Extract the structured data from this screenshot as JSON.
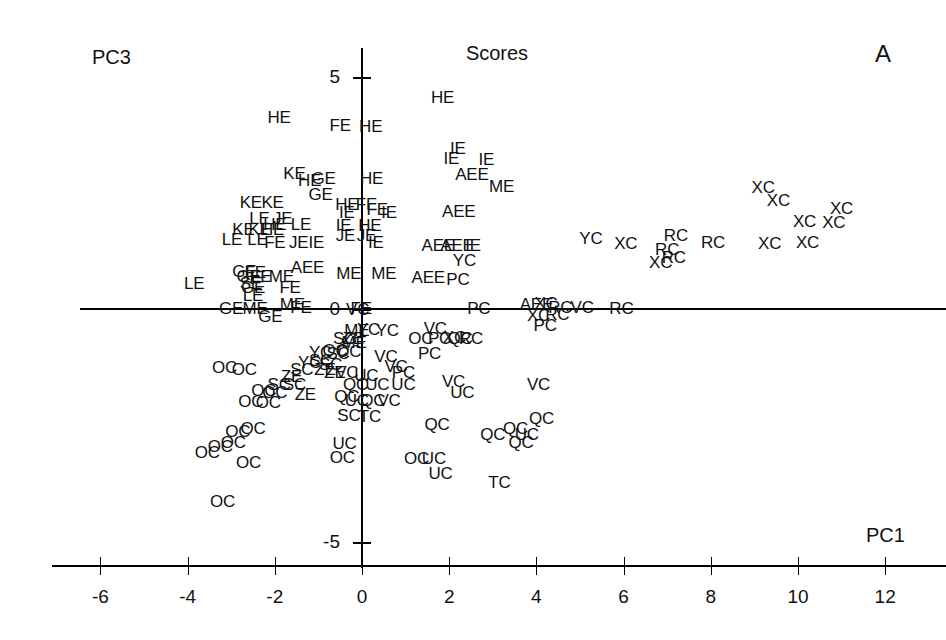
{
  "chart_data": {
    "type": "scatter",
    "title": "Scores",
    "panel_label": "A",
    "xlabel": "PC1",
    "ylabel": "PC3",
    "xlim": [
      -6.6,
      12.6
    ],
    "ylim": [
      -5.6,
      5.6
    ],
    "xticks": [
      -6,
      -4,
      -2,
      0,
      2,
      4,
      6,
      8,
      10,
      12
    ],
    "xtick_labels": [
      "-6",
      "-4",
      "-2",
      "0",
      "2",
      "4",
      "6",
      "8",
      "10",
      "12"
    ],
    "yticks": [
      -5,
      0,
      5
    ],
    "ytick_labels": [
      "-5",
      "0",
      "5"
    ],
    "grid": false,
    "legend": "none",
    "marker_style": "text-label",
    "group_labels": [
      "HE",
      "FE",
      "GE",
      "KE",
      "LE",
      "JE",
      "IE",
      "ME",
      "AEE",
      "YC",
      "XC",
      "RC",
      "VC",
      "PC",
      "OC",
      "SC",
      "ZE",
      "UC",
      "QC",
      "TC"
    ],
    "points": [
      {
        "label": "HE",
        "x": -1.9,
        "y": 4.12
      },
      {
        "label": "FE",
        "x": -0.5,
        "y": 3.95
      },
      {
        "label": "HE",
        "x": 0.2,
        "y": 3.93
      },
      {
        "label": "HE",
        "x": 1.85,
        "y": 4.55
      },
      {
        "label": "IE",
        "x": 2.2,
        "y": 3.47
      },
      {
        "label": "IE",
        "x": 2.05,
        "y": 3.25
      },
      {
        "label": "IE",
        "x": 2.85,
        "y": 3.22
      },
      {
        "label": "KE",
        "x": -1.55,
        "y": 2.92
      },
      {
        "label": "HE",
        "x": -1.2,
        "y": 2.78
      },
      {
        "label": "GE",
        "x": -0.88,
        "y": 2.82
      },
      {
        "label": "HE",
        "x": 0.22,
        "y": 2.82
      },
      {
        "label": "AEE",
        "x": 2.52,
        "y": 2.9
      },
      {
        "label": "ME",
        "x": 3.2,
        "y": 2.65
      },
      {
        "label": "GE",
        "x": -0.95,
        "y": 2.48
      },
      {
        "label": "KE",
        "x": -2.55,
        "y": 2.3
      },
      {
        "label": "KE",
        "x": -2.05,
        "y": 2.3
      },
      {
        "label": "HE",
        "x": -0.35,
        "y": 2.25
      },
      {
        "label": "FE",
        "x": 0.1,
        "y": 2.25
      },
      {
        "label": "IE",
        "x": -0.35,
        "y": 2.08
      },
      {
        "label": "FE",
        "x": 0.35,
        "y": 2.16
      },
      {
        "label": "IE",
        "x": 0.62,
        "y": 2.08
      },
      {
        "label": "AEE",
        "x": 2.22,
        "y": 2.1
      },
      {
        "label": "XC",
        "x": 9.2,
        "y": 2.62
      },
      {
        "label": "XC",
        "x": 9.55,
        "y": 2.35
      },
      {
        "label": "XC",
        "x": 11.0,
        "y": 2.18
      },
      {
        "label": "LE",
        "x": -2.35,
        "y": 1.95
      },
      {
        "label": "JE",
        "x": -1.82,
        "y": 1.95
      },
      {
        "label": "HE",
        "x": -2.0,
        "y": 1.82
      },
      {
        "label": "LE",
        "x": -1.4,
        "y": 1.82
      },
      {
        "label": "IE",
        "x": -0.42,
        "y": 1.8
      },
      {
        "label": "HE",
        "x": 0.18,
        "y": 1.8
      },
      {
        "label": "KE",
        "x": -2.72,
        "y": 1.72
      },
      {
        "label": "KE",
        "x": -2.35,
        "y": 1.72
      },
      {
        "label": "HE",
        "x": -2.05,
        "y": 1.72
      },
      {
        "label": "JE",
        "x": -0.38,
        "y": 1.6
      },
      {
        "label": "JE",
        "x": 0.1,
        "y": 1.6
      },
      {
        "label": "RC",
        "x": 7.2,
        "y": 1.6
      },
      {
        "label": "XC",
        "x": 10.15,
        "y": 1.9
      },
      {
        "label": "XC",
        "x": 10.82,
        "y": 1.88
      },
      {
        "label": "LE",
        "x": -2.98,
        "y": 1.5
      },
      {
        "label": "LE",
        "x": -2.4,
        "y": 1.5
      },
      {
        "label": "FE",
        "x": -2.0,
        "y": 1.45
      },
      {
        "label": "JE",
        "x": -1.45,
        "y": 1.45
      },
      {
        "label": "IE",
        "x": -1.05,
        "y": 1.45
      },
      {
        "label": "IE",
        "x": 0.32,
        "y": 1.45
      },
      {
        "label": "AEE",
        "x": 1.75,
        "y": 1.38
      },
      {
        "label": "AEE",
        "x": 2.18,
        "y": 1.38
      },
      {
        "label": "IE",
        "x": 2.55,
        "y": 1.38
      },
      {
        "label": "YC",
        "x": 5.25,
        "y": 1.52
      },
      {
        "label": "XC",
        "x": 6.05,
        "y": 1.42
      },
      {
        "label": "RC",
        "x": 7.0,
        "y": 1.3
      },
      {
        "label": "RC",
        "x": 7.15,
        "y": 1.12
      },
      {
        "label": "XC",
        "x": 6.85,
        "y": 1.02
      },
      {
        "label": "RC",
        "x": 8.05,
        "y": 1.45
      },
      {
        "label": "XC",
        "x": 9.35,
        "y": 1.42
      },
      {
        "label": "XC",
        "x": 10.22,
        "y": 1.45
      },
      {
        "label": "GE",
        "x": -2.7,
        "y": 0.82
      },
      {
        "label": "GE",
        "x": -2.6,
        "y": 0.72
      },
      {
        "label": "FE",
        "x": -2.45,
        "y": 0.8
      },
      {
        "label": "FE",
        "x": -2.32,
        "y": 0.72
      },
      {
        "label": "ME",
        "x": -1.85,
        "y": 0.72
      },
      {
        "label": "AEE",
        "x": -1.25,
        "y": 0.9
      },
      {
        "label": "ME",
        "x": -0.3,
        "y": 0.78
      },
      {
        "label": "ME",
        "x": 0.5,
        "y": 0.78
      },
      {
        "label": "AEE",
        "x": 1.52,
        "y": 0.68
      },
      {
        "label": "PC",
        "x": 2.2,
        "y": 0.65
      },
      {
        "label": "YC",
        "x": 2.35,
        "y": 1.05
      },
      {
        "label": "SE",
        "x": -2.55,
        "y": 0.55
      },
      {
        "label": "GE",
        "x": -2.5,
        "y": 0.48
      },
      {
        "label": "FE",
        "x": -1.65,
        "y": 0.48
      },
      {
        "label": "LE",
        "x": -3.85,
        "y": 0.55
      },
      {
        "label": "LE",
        "x": -2.5,
        "y": 0.3
      },
      {
        "label": "GE",
        "x": -3.0,
        "y": 0.02
      },
      {
        "label": "GE",
        "x": -2.1,
        "y": -0.15
      },
      {
        "label": "ME",
        "x": -2.45,
        "y": 0.02
      },
      {
        "label": "ME",
        "x": -1.6,
        "y": 0.1
      },
      {
        "label": "FE",
        "x": -1.4,
        "y": 0.05
      },
      {
        "label": "VC",
        "x": -0.1,
        "y": 0.0
      },
      {
        "label": "FE",
        "x": -0.02,
        "y": 0.02
      },
      {
        "label": "ME",
        "x": -0.12,
        "y": -0.45
      },
      {
        "label": "PC",
        "x": 2.68,
        "y": 0.02
      },
      {
        "label": "AEE",
        "x": 4.0,
        "y": 0.1
      },
      {
        "label": "XC",
        "x": 4.22,
        "y": 0.12
      },
      {
        "label": "XC",
        "x": 4.05,
        "y": -0.12
      },
      {
        "label": "RC",
        "x": 4.48,
        "y": -0.1
      },
      {
        "label": "RC",
        "x": 4.55,
        "y": 0.05
      },
      {
        "label": "VC",
        "x": 5.05,
        "y": 0.05
      },
      {
        "label": "RC",
        "x": 5.95,
        "y": 0.02
      },
      {
        "label": "PC",
        "x": 4.2,
        "y": -0.35
      },
      {
        "label": "YC",
        "x": 0.15,
        "y": -0.42
      },
      {
        "label": "YC",
        "x": 0.58,
        "y": -0.45
      },
      {
        "label": "VC",
        "x": 1.68,
        "y": -0.4
      },
      {
        "label": "OC",
        "x": 1.35,
        "y": -0.62
      },
      {
        "label": "PC",
        "x": 1.78,
        "y": -0.62
      },
      {
        "label": "XC",
        "x": 2.12,
        "y": -0.6
      },
      {
        "label": "QC",
        "x": 2.25,
        "y": -0.62
      },
      {
        "label": "RC",
        "x": 2.5,
        "y": -0.62
      },
      {
        "label": "SC",
        "x": -0.4,
        "y": -0.62
      },
      {
        "label": "ZE",
        "x": -0.2,
        "y": -0.62
      },
      {
        "label": "ME",
        "x": -0.18,
        "y": -0.72
      },
      {
        "label": "YC",
        "x": -0.95,
        "y": -0.92
      },
      {
        "label": "OC",
        "x": -0.62,
        "y": -0.88
      },
      {
        "label": "OC",
        "x": -0.3,
        "y": -0.9
      },
      {
        "label": "SC",
        "x": -0.55,
        "y": -0.95
      },
      {
        "label": "PC",
        "x": 1.55,
        "y": -0.95
      },
      {
        "label": "VC",
        "x": 0.55,
        "y": -1.02
      },
      {
        "label": "VC",
        "x": 0.78,
        "y": -1.22
      },
      {
        "label": "SC",
        "x": -0.95,
        "y": -1.1
      },
      {
        "label": "SC",
        "x": -0.72,
        "y": -1.18
      },
      {
        "label": "YC",
        "x": -1.2,
        "y": -1.15
      },
      {
        "label": "ZE",
        "x": -0.85,
        "y": -1.3
      },
      {
        "label": "SC",
        "x": -1.38,
        "y": -1.3
      },
      {
        "label": "ZE",
        "x": -0.62,
        "y": -1.35
      },
      {
        "label": "VC",
        "x": -0.35,
        "y": -1.35
      },
      {
        "label": "UC",
        "x": 0.1,
        "y": -1.42
      },
      {
        "label": "PC",
        "x": 0.95,
        "y": -1.35
      },
      {
        "label": "OC",
        "x": -3.15,
        "y": -1.25
      },
      {
        "label": "OC",
        "x": -2.7,
        "y": -1.3
      },
      {
        "label": "ZE",
        "x": -1.62,
        "y": -1.45
      },
      {
        "label": "QC",
        "x": -0.15,
        "y": -1.62
      },
      {
        "label": "UC",
        "x": 0.35,
        "y": -1.62
      },
      {
        "label": "UC",
        "x": 0.95,
        "y": -1.62
      },
      {
        "label": "VC",
        "x": 2.1,
        "y": -1.55
      },
      {
        "label": "UC",
        "x": 2.3,
        "y": -1.78
      },
      {
        "label": "VC",
        "x": 4.05,
        "y": -1.62
      },
      {
        "label": "SC",
        "x": -1.9,
        "y": -1.62
      },
      {
        "label": "SC",
        "x": -1.55,
        "y": -1.62
      },
      {
        "label": "OC",
        "x": -2.25,
        "y": -1.75
      },
      {
        "label": "OC",
        "x": -2.0,
        "y": -1.78
      },
      {
        "label": "ZE",
        "x": -1.3,
        "y": -1.82
      },
      {
        "label": "QC",
        "x": -0.35,
        "y": -1.88
      },
      {
        "label": "UC",
        "x": -0.12,
        "y": -1.95
      },
      {
        "label": "QC",
        "x": 0.25,
        "y": -1.95
      },
      {
        "label": "VC",
        "x": 0.62,
        "y": -1.95
      },
      {
        "label": "OC",
        "x": -2.55,
        "y": -1.98
      },
      {
        "label": "OC",
        "x": -2.15,
        "y": -2.0
      },
      {
        "label": "SC",
        "x": -0.3,
        "y": -2.28
      },
      {
        "label": "TC",
        "x": 0.18,
        "y": -2.3
      },
      {
        "label": "QC",
        "x": 1.72,
        "y": -2.48
      },
      {
        "label": "QC",
        "x": 3.0,
        "y": -2.68
      },
      {
        "label": "QC",
        "x": 3.52,
        "y": -2.55
      },
      {
        "label": "QC",
        "x": 4.12,
        "y": -2.35
      },
      {
        "label": "UC",
        "x": 3.78,
        "y": -2.68
      },
      {
        "label": "QC",
        "x": 3.65,
        "y": -2.85
      },
      {
        "label": "OC",
        "x": -2.85,
        "y": -2.62
      },
      {
        "label": "OC",
        "x": -2.5,
        "y": -2.55
      },
      {
        "label": "OC",
        "x": -3.25,
        "y": -2.95
      },
      {
        "label": "OC",
        "x": -2.95,
        "y": -2.85
      },
      {
        "label": "OC",
        "x": -3.55,
        "y": -3.08
      },
      {
        "label": "OC",
        "x": -2.6,
        "y": -3.3
      },
      {
        "label": "OC",
        "x": 1.25,
        "y": -3.2
      },
      {
        "label": "UC",
        "x": 1.65,
        "y": -3.2
      },
      {
        "label": "UC",
        "x": -0.4,
        "y": -2.88
      },
      {
        "label": "OC",
        "x": -0.45,
        "y": -3.18
      },
      {
        "label": "UC",
        "x": 1.8,
        "y": -3.52
      },
      {
        "label": "TC",
        "x": 3.15,
        "y": -3.72
      },
      {
        "label": "OC",
        "x": -3.2,
        "y": -4.12
      }
    ]
  }
}
